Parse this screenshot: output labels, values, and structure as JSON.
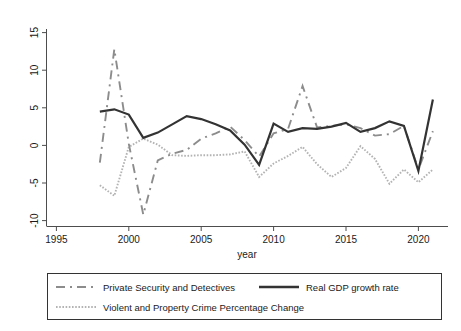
{
  "chart_data": {
    "type": "line",
    "title": "",
    "xlabel": "year",
    "ylabel": "",
    "xlim": [
      1995,
      2021.6
    ],
    "ylim": [
      -10.5,
      16
    ],
    "grid": false,
    "legend_position": "bottom",
    "x_ticks": [
      "1995",
      "2000",
      "2005",
      "2010",
      "2015",
      "2020"
    ],
    "x_tick_values": [
      1995,
      2000,
      2005,
      2010,
      2015,
      2020
    ],
    "y_ticks": [
      "15",
      "10",
      "5",
      "0",
      "-5",
      "-10"
    ],
    "y_tick_values": [
      15,
      10,
      5,
      0,
      -5,
      -10
    ],
    "x": [
      1998,
      1999,
      2000,
      2001,
      2002,
      2003,
      2004,
      2005,
      2006,
      2007,
      2008,
      2009,
      2010,
      2011,
      2012,
      2013,
      2014,
      2015,
      2016,
      2017,
      2018,
      2019,
      2020,
      2021
    ],
    "series": [
      {
        "name": "Private Security and Detectives",
        "style": "dashed",
        "color": "#8c8c8c",
        "values": [
          -2.3,
          12.8,
          0.2,
          -9.2,
          -2.0,
          -1.1,
          -0.6,
          0.9,
          1.6,
          2.5,
          0.7,
          -1.5,
          1.6,
          2.2,
          7.9,
          2.4,
          2.6,
          2.8,
          2.3,
          1.3,
          1.5,
          2.6,
          -3.2,
          1.9
        ]
      },
      {
        "name": "Real GDP growth rate",
        "style": "solid",
        "color": "#333333",
        "values": [
          4.5,
          4.8,
          4.1,
          1.0,
          1.7,
          2.8,
          3.9,
          3.5,
          2.8,
          2.0,
          0.1,
          -2.6,
          2.9,
          1.8,
          2.3,
          2.2,
          2.5,
          3.0,
          1.8,
          2.3,
          3.2,
          2.6,
          -3.4,
          6.1
        ]
      },
      {
        "name": "Violent and Property Crime Percentage Change",
        "style": "dotted",
        "color": "#b3b3b3",
        "values": [
          -5.3,
          -6.7,
          -0.2,
          0.9,
          0.1,
          -1.3,
          -1.4,
          -1.3,
          -1.3,
          -1.2,
          -0.8,
          -4.2,
          -2.4,
          -1.4,
          -0.2,
          -2.5,
          -4.2,
          -3.0,
          -0.1,
          -1.8,
          -5.1,
          -3.2,
          -4.9,
          -3.2
        ]
      }
    ]
  },
  "legend": {
    "entries": [
      {
        "label": "Private Security and Detectives",
        "style": "dashed",
        "color": "#8c8c8c"
      },
      {
        "label": "Real GDP growth rate",
        "style": "solid",
        "color": "#333333"
      },
      {
        "label": "Violent and Property Crime Percentage Change",
        "style": "dotted",
        "color": "#b3b3b3"
      }
    ]
  },
  "axes": {
    "x_title": "year"
  }
}
